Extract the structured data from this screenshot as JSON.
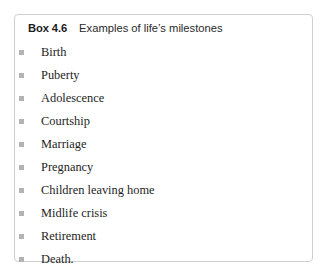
{
  "box": {
    "label": "Box 4.6",
    "title": "Examples of life’s milestones",
    "border_color": "#cfcfcf",
    "background_color": "#ffffff",
    "bullet_color": "#b3b3b3",
    "text_color": "#1e1e1e",
    "items": [
      {
        "text": "Birth"
      },
      {
        "text": "Puberty"
      },
      {
        "text": "Adolescence"
      },
      {
        "text": "Courtship"
      },
      {
        "text": "Marriage"
      },
      {
        "text": "Pregnancy"
      },
      {
        "text": "Children leaving home"
      },
      {
        "text": "Midlife crisis"
      },
      {
        "text": "Retirement"
      },
      {
        "text": "Death."
      }
    ]
  }
}
